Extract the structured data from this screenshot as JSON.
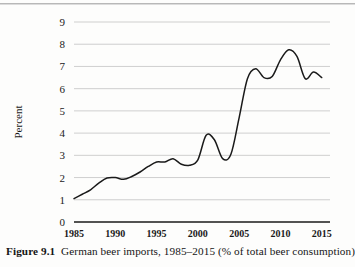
{
  "caption": {
    "label": "Figure 9.1",
    "text": "German beer imports, 1985–2015 (% of total beer consumption)"
  },
  "chart_data": {
    "type": "line",
    "title": "",
    "xlabel": "",
    "ylabel": "Percent",
    "xlim": [
      1985,
      2016
    ],
    "ylim": [
      0,
      9
    ],
    "grid": true,
    "legend": false,
    "line_color": "#1a1a1a",
    "grid_color": "#c9c9c9",
    "axis_color": "#1a1a1a",
    "ytick_labels": [
      "0",
      "1",
      "2",
      "3",
      "4",
      "5",
      "6",
      "7",
      "8",
      "9"
    ],
    "ytick_values": [
      0,
      1,
      2,
      3,
      4,
      5,
      6,
      7,
      8,
      9
    ],
    "xtick_labels": [
      "1985",
      "1990",
      "1995",
      "2000",
      "2005",
      "2010",
      "2015"
    ],
    "xtick_values": [
      1985,
      1990,
      1995,
      2000,
      2005,
      2010,
      2015
    ],
    "x": [
      1985,
      1986,
      1987,
      1988,
      1989,
      1990,
      1991,
      1992,
      1993,
      1994,
      1995,
      1996,
      1997,
      1998,
      1999,
      2000,
      2001,
      2002,
      2003,
      2004,
      2005,
      2006,
      2007,
      2008,
      2009,
      2010,
      2011,
      2012,
      2013,
      2014,
      2015
    ],
    "values": [
      1.05,
      1.25,
      1.45,
      1.75,
      1.98,
      2.0,
      1.92,
      2.05,
      2.25,
      2.5,
      2.7,
      2.7,
      2.85,
      2.6,
      2.55,
      2.8,
      3.9,
      3.7,
      2.85,
      3.05,
      4.7,
      6.45,
      6.9,
      6.5,
      6.55,
      7.3,
      7.75,
      7.45,
      6.45,
      6.75,
      6.5
    ],
    "series": [
      {
        "name": "German beer imports (% of total beer consumption)",
        "values": [
          1.05,
          1.25,
          1.45,
          1.75,
          1.98,
          2.0,
          1.92,
          2.05,
          2.25,
          2.5,
          2.7,
          2.7,
          2.85,
          2.6,
          2.55,
          2.8,
          3.9,
          3.7,
          2.85,
          3.05,
          4.7,
          6.45,
          6.9,
          6.5,
          6.55,
          7.3,
          7.75,
          7.45,
          6.45,
          6.75,
          6.5
        ]
      }
    ]
  }
}
